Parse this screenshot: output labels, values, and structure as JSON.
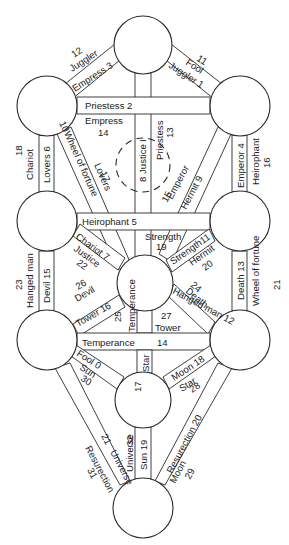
{
  "sephiroth": [
    {
      "id": "top",
      "cx": 143,
      "cy": 45,
      "r": 29
    },
    {
      "id": "upper-left",
      "cx": 47,
      "cy": 106,
      "r": 30
    },
    {
      "id": "upper-right",
      "cx": 240,
      "cy": 106,
      "r": 30
    },
    {
      "id": "middle-left",
      "cx": 47,
      "cy": 221,
      "r": 30
    },
    {
      "id": "middle-right",
      "cx": 240,
      "cy": 221,
      "r": 30
    },
    {
      "id": "center",
      "cx": 145,
      "cy": 283,
      "r": 28
    },
    {
      "id": "lower-left",
      "cx": 47,
      "cy": 340,
      "r": 30
    },
    {
      "id": "lower-right",
      "cx": 240,
      "cy": 340,
      "r": 30
    },
    {
      "id": "yesod",
      "cx": 143,
      "cy": 400,
      "r": 28
    },
    {
      "id": "bottom",
      "cx": 143,
      "cy": 508,
      "r": 30
    }
  ],
  "labels": {
    "top_left_path": {
      "outer_number": "12",
      "outer_name": "Juggler",
      "inner": "Empress 3"
    },
    "top_right_path": {
      "outer_number": "11",
      "outer_name": "Fool",
      "inner": "Juggler 1"
    },
    "upper_horizontal": {
      "inner": "Priestess 2",
      "below_name": "Empress",
      "below_number": "14"
    },
    "left_upper_vertical": {
      "outer_number": "18",
      "outer_name": "Chariot",
      "inner": "Lovers 6"
    },
    "right_upper_vertical": {
      "inner": "Emperor 4",
      "outer_name": "Heirophant",
      "outer_number": "16"
    },
    "left_diagonal_upper": {
      "inner_number": "10",
      "inner_name": "Wheel of fortune",
      "outer_name": "Lovers",
      "outer_number": "17"
    },
    "right_diagonal_upper": {
      "inner": "Hermit 9",
      "outer_name": "Emperor",
      "outer_number": "15"
    },
    "center_top_vertical": {
      "inner": "8 Justice",
      "marker": "I",
      "outer_name": "Priestess",
      "outer_number": "13"
    },
    "middle_horizontal": {
      "inner": "Heirophant 5"
    },
    "strength_left": {
      "name": "Strength",
      "number": "19"
    },
    "strength_right": {
      "inner": "Strength11",
      "outer_name": "Hermit",
      "outer_number": "20"
    },
    "left_to_center_upper": {
      "inner": "Chariot 7",
      "outer_name": "Justice",
      "outer_number": "22"
    },
    "left_middle_vertical": {
      "outer_number": "23",
      "outer_name": "Hanged man",
      "inner": "Devil 15"
    },
    "right_middle_vertical": {
      "inner": "Death 13",
      "outer_name": "Wheel of fortune",
      "outer_number": "21"
    },
    "left_to_center_lower": {
      "inner": "Tower 16",
      "outer_name": "Devil",
      "outer_number": "26"
    },
    "right_to_center_lower": {
      "inner": "Hanged man 12",
      "outer_name": "Death",
      "outer_number": "24"
    },
    "center_bottom_vertical": {
      "inner": "Temperance",
      "number": "25"
    },
    "center_right_lower": {
      "number": "27",
      "name": "Tower"
    },
    "lower_horizontal": {
      "name": "Temperance",
      "number": "14"
    },
    "lower_left_to_yesod": {
      "inner": "Fool 0",
      "outer_name": "Sun",
      "outer_number": "30"
    },
    "lower_right_to_yesod": {
      "inner": "Moon 18",
      "outer_name": "Star",
      "outer_number": "28"
    },
    "center_to_yesod": {
      "inner": "Star",
      "number": "17"
    },
    "yesod_to_bottom": {
      "inner": "Sun 19",
      "outer_name": "Universe",
      "outer_number": "32"
    },
    "lower_left_to_bottom": {
      "inner_number": "21",
      "inner_name": "Universe",
      "outer_name": "Resurection",
      "outer_number": "31"
    },
    "lower_right_to_bottom": {
      "inner": "Resurection 20",
      "outer_name": "Moon",
      "outer_number": "29"
    }
  }
}
